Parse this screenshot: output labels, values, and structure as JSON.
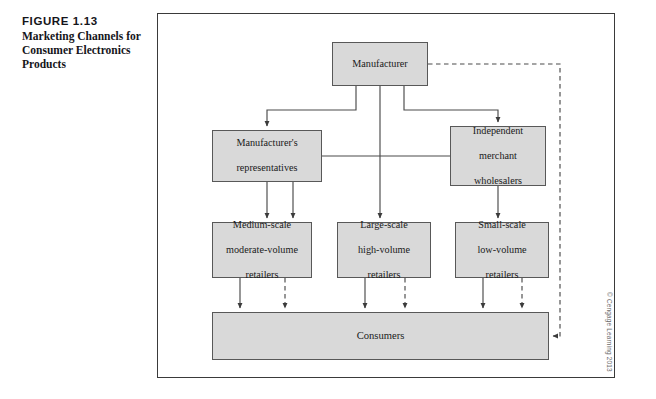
{
  "caption": {
    "figure_number": "FIGURE 1.13",
    "title_line1": "Marketing Channels for",
    "title_line2": "Consumer Electronics",
    "title_line3": "Products"
  },
  "copyright": "© Cengage Learning 2013",
  "colors": {
    "box_fill": "#d9d9d9",
    "box_border": "#585858",
    "frame_border": "#3a3a3a",
    "line": "#4a4a4a",
    "text": "#1a1a1a"
  },
  "diagram": {
    "type": "flowchart",
    "nodes": [
      {
        "id": "manufacturer",
        "label": "Manufacturer",
        "lines": [
          "Manufacturer"
        ],
        "level": 1
      },
      {
        "id": "reps",
        "label": "Manufacturer's representatives",
        "lines": [
          "Manufacturer's",
          "representatives"
        ],
        "level": 2
      },
      {
        "id": "wholesalers",
        "label": "Independent merchant wholesalers",
        "lines": [
          "Independent",
          "merchant",
          "wholesalers"
        ],
        "level": 2
      },
      {
        "id": "medium",
        "label": "Medium-scale moderate-volume retailers",
        "lines": [
          "Medium-scale",
          "moderate-volume",
          "retailers"
        ],
        "level": 3
      },
      {
        "id": "large",
        "label": "Large-scale high-volume retailers",
        "lines": [
          "Large-scale",
          "high-volume",
          "retailers"
        ],
        "level": 3
      },
      {
        "id": "small",
        "label": "Small-scale low-volume retailers",
        "lines": [
          "Small-scale",
          "low-volume",
          "retailers"
        ],
        "level": 3
      },
      {
        "id": "consumers",
        "label": "Consumers",
        "lines": [
          "Consumers"
        ],
        "level": 4
      }
    ],
    "edges": [
      {
        "from": "manufacturer",
        "to": "reps",
        "style": "solid"
      },
      {
        "from": "manufacturer",
        "to": "large",
        "style": "solid"
      },
      {
        "from": "manufacturer",
        "to": "wholesalers",
        "style": "solid"
      },
      {
        "from": "manufacturer",
        "to": "consumers",
        "style": "dashed"
      },
      {
        "from": "reps",
        "to": "medium",
        "style": "solid"
      },
      {
        "from": "wholesalers",
        "to": "medium",
        "style": "solid"
      },
      {
        "from": "wholesalers",
        "to": "small",
        "style": "solid"
      },
      {
        "from": "medium",
        "to": "consumers",
        "style": "solid"
      },
      {
        "from": "medium",
        "to": "consumers",
        "style": "dashed"
      },
      {
        "from": "large",
        "to": "consumers",
        "style": "solid"
      },
      {
        "from": "large",
        "to": "consumers",
        "style": "dashed"
      },
      {
        "from": "small",
        "to": "consumers",
        "style": "solid"
      },
      {
        "from": "small",
        "to": "consumers",
        "style": "dashed"
      }
    ]
  }
}
